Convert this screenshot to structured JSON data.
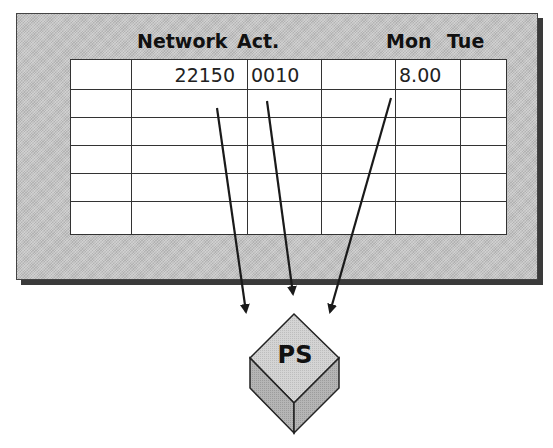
{
  "headers": {
    "network": "Network",
    "activity": "Act.",
    "mon": "Mon",
    "tue": "Tue"
  },
  "table": {
    "row1": {
      "network": "22150",
      "activity": "0010",
      "mon": "8.00"
    },
    "empty_rows": 5
  },
  "target": {
    "label": "PS"
  }
}
